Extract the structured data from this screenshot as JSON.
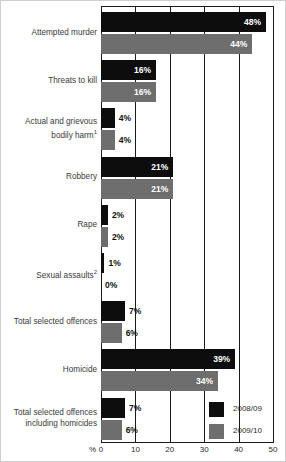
{
  "chart_data": {
    "type": "bar",
    "title": "",
    "xlabel": "%",
    "ylabel": "",
    "orientation": "horizontal",
    "xlim": [
      0,
      50
    ],
    "grid": true,
    "legend_position": "bottom-right",
    "xticks": [
      "0",
      "10",
      "20",
      "30",
      "40",
      "50"
    ],
    "xtick_values": [
      0,
      10,
      20,
      30,
      40,
      50
    ],
    "pct_symbol": "%",
    "categories": [
      "Attempted murder",
      "Threats to kill",
      "Actual and grievous bodily harm",
      "Robbery",
      "Rape",
      "Sexual assaults",
      "Total selected offences",
      "Homicide",
      "Total selected offences including homicides"
    ],
    "category_footnotes": [
      "",
      "",
      "1",
      "",
      "",
      "2",
      "",
      "",
      ""
    ],
    "series": [
      {
        "name": "2008/09",
        "color": "#0d0d0d",
        "values": [
          48,
          16,
          4,
          21,
          2,
          1,
          7,
          39,
          7
        ],
        "labels": [
          "48%",
          "16%",
          "4%",
          "21%",
          "2%",
          "1%",
          "7%",
          "39%",
          "7%"
        ]
      },
      {
        "name": "2009/10",
        "color": "#6e6e6e",
        "values": [
          44,
          16,
          4,
          21,
          2,
          0,
          6,
          34,
          6
        ],
        "labels": [
          "44%",
          "16%",
          "4%",
          "21%",
          "2%",
          "0%",
          "6%",
          "34%",
          "6%"
        ]
      }
    ]
  },
  "legend": {
    "items": [
      {
        "label": "2008/09",
        "color": "#0d0d0d"
      },
      {
        "label": "2009/10",
        "color": "#6e6e6e"
      }
    ]
  }
}
